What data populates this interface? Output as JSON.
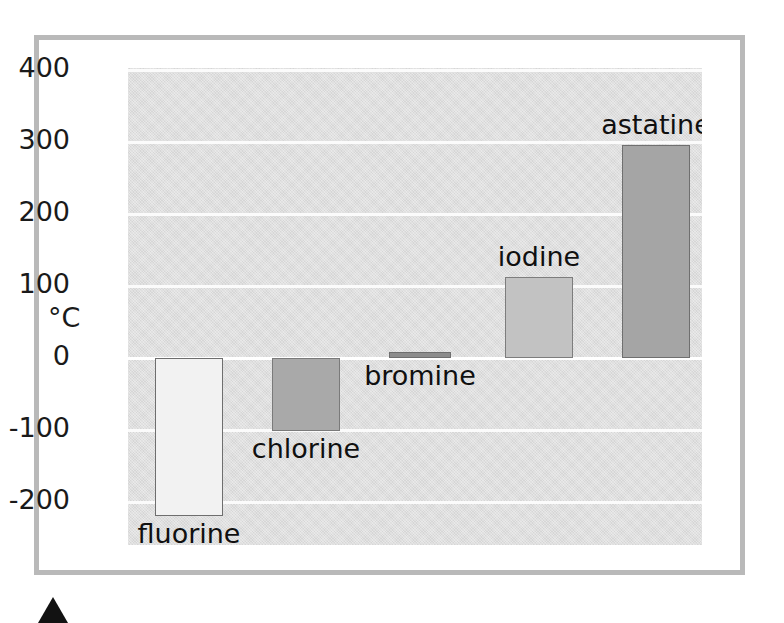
{
  "chart_data": {
    "type": "bar",
    "title": "",
    "subtitle": "",
    "xlabel": "",
    "ylabel": "°C",
    "ylim": [
      -260,
      400
    ],
    "grid": true,
    "legend": "none",
    "orientation": "vertical",
    "baseline": 0,
    "categories": [
      "fluorine",
      "chlorine",
      "bromine",
      "iodine",
      "astatine"
    ],
    "values": [
      -220,
      -102,
      8,
      113,
      296
    ],
    "ytick_labels": [
      "400",
      "300",
      "200",
      "100",
      "0",
      "-100",
      "-200"
    ],
    "ytick_values": [
      400,
      300,
      200,
      100,
      0,
      -100,
      -200
    ],
    "bars": [
      {
        "name": "fluorine",
        "label": "fluorine",
        "value": -220,
        "fill": "#f2f2f2",
        "stroke": "#6e6e6e",
        "label_position": "below"
      },
      {
        "name": "chlorine",
        "label": "chlorine",
        "value": -102,
        "fill": "#a9a9a9",
        "stroke": "#7a7a7a",
        "label_position": "below"
      },
      {
        "name": "bromine",
        "label": "bromine",
        "value": 8,
        "fill": "#8c8c8c",
        "stroke": "#6e6e6e",
        "label_position": "below"
      },
      {
        "name": "iodine",
        "label": "iodine",
        "value": 113,
        "fill": "#c2c2c2",
        "stroke": "#7d7d7d",
        "label_position": "above"
      },
      {
        "name": "astatine",
        "label": "astatine",
        "value": 296,
        "fill": "#a5a5a5",
        "stroke": "#6f6f6f",
        "label_position": "above"
      }
    ],
    "colors": {
      "plot_background": "#d6d6d6",
      "gridline": "#fbfbfb",
      "frame_border": "#b9b9b9",
      "text": "#1a1a1a",
      "arrow": "#121212"
    }
  }
}
